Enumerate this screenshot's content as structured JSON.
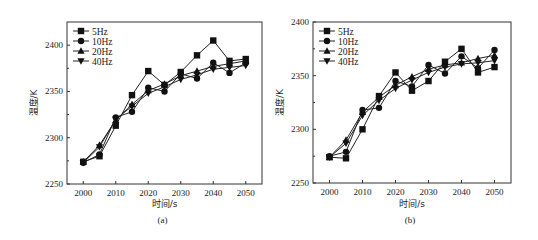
{
  "chart_data": [
    {
      "type": "line",
      "panel_label": "(a)",
      "title": "",
      "xlabel": "时间/s",
      "ylabel": "温度/K",
      "xlim": [
        1995,
        2055
      ],
      "ylim": [
        2250,
        2425
      ],
      "x_ticks": [
        2000,
        2010,
        2020,
        2030,
        2040,
        2050
      ],
      "y_ticks": [
        2250,
        2300,
        2350,
        2400
      ],
      "grid": false,
      "legend_position": "top-left",
      "x": [
        2000,
        2005,
        2010,
        2015,
        2020,
        2025,
        2030,
        2035,
        2040,
        2045,
        2050
      ],
      "series": [
        {
          "name": "5Hz",
          "marker": "square",
          "values": [
            2274,
            2280,
            2313,
            2346,
            2372,
            2357,
            2371,
            2389,
            2405,
            2383,
            2385
          ]
        },
        {
          "name": "10Hz",
          "marker": "circle",
          "values": [
            2273,
            2282,
            2322,
            2328,
            2354,
            2350,
            2369,
            2364,
            2381,
            2370,
            2381
          ]
        },
        {
          "name": "20Hz",
          "marker": "triangle-up",
          "values": [
            2274,
            2292,
            2319,
            2336,
            2351,
            2358,
            2367,
            2372,
            2377,
            2380,
            2383
          ]
        },
        {
          "name": "40Hz",
          "marker": "triangle-down",
          "values": [
            2273,
            2290,
            2320,
            2334,
            2348,
            2355,
            2363,
            2368,
            2374,
            2376,
            2378
          ]
        }
      ]
    },
    {
      "type": "line",
      "panel_label": "(b)",
      "title": "",
      "xlabel": "时间/s",
      "ylabel": "温度/K",
      "xlim": [
        1995,
        2055
      ],
      "ylim": [
        2250,
        2400
      ],
      "x_ticks": [
        2000,
        2010,
        2020,
        2030,
        2040,
        2050
      ],
      "y_ticks": [
        2250,
        2300,
        2350,
        2400
      ],
      "grid": false,
      "legend_position": "top-left",
      "x": [
        2000,
        2005,
        2010,
        2015,
        2020,
        2025,
        2030,
        2035,
        2040,
        2045,
        2050
      ],
      "series": [
        {
          "name": "5Hz",
          "marker": "square",
          "values": [
            2274,
            2273,
            2300,
            2331,
            2353,
            2336,
            2345,
            2363,
            2375,
            2353,
            2358
          ]
        },
        {
          "name": "10Hz",
          "marker": "circle",
          "values": [
            2275,
            2279,
            2318,
            2320,
            2345,
            2340,
            2360,
            2352,
            2368,
            2357,
            2374
          ]
        },
        {
          "name": "20Hz",
          "marker": "triangle-up",
          "values": [
            2274,
            2290,
            2316,
            2330,
            2341,
            2349,
            2356,
            2360,
            2362,
            2366,
            2369
          ]
        },
        {
          "name": "40Hz",
          "marker": "triangle-down",
          "values": [
            2274,
            2287,
            2313,
            2327,
            2338,
            2346,
            2353,
            2358,
            2361,
            2362,
            2364
          ]
        }
      ]
    }
  ]
}
